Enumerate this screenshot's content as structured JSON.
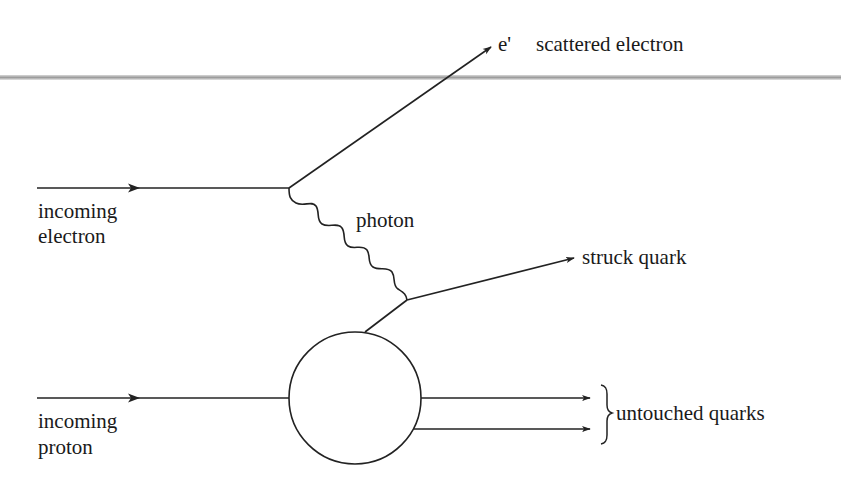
{
  "diagram": {
    "labels": {
      "scattered_symbol": "e'",
      "scattered": "scattered electron",
      "incoming_electron_1": "incoming",
      "incoming_electron_2": "electron",
      "photon": "photon",
      "struck_quark": "struck quark",
      "incoming_proton_1": "incoming",
      "incoming_proton_2": "proton",
      "untouched": "untouched quarks"
    },
    "colors": {
      "line": "#222222",
      "divider": "#a8a8a8",
      "background": "#ffffff"
    }
  }
}
